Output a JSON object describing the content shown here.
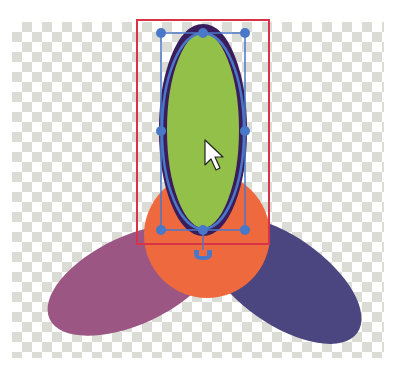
{
  "canvas": {
    "background": "transparency-checkerboard",
    "checker_color": "#dcdcd6"
  },
  "artwork": {
    "left_petal": {
      "shape": "ellipse",
      "color": "#9b5683"
    },
    "right_petal": {
      "shape": "ellipse",
      "color": "#4b4680"
    },
    "center_circle": {
      "shape": "circle",
      "color": "#ee6a3e"
    },
    "top_petal": {
      "shape": "ellipse",
      "color": "#92c048",
      "stroke": "#3a1d5c"
    }
  },
  "selection": {
    "bounding_box_color": "#d9334a",
    "path_color": "#4a78c8",
    "handle_color": "#4a78c8",
    "handles": 8
  },
  "cursor": {
    "type": "arrow-pointer"
  },
  "a11y": {
    "title": "Vector editor canvas with selected ellipse"
  }
}
